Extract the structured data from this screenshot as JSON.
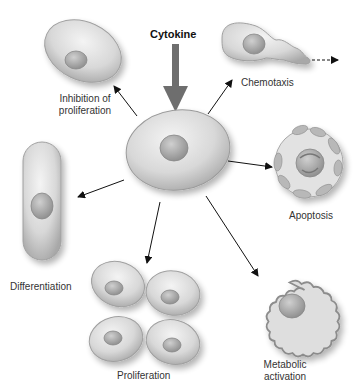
{
  "diagram": {
    "center_input": "Cytokine",
    "center_node": "Target cell",
    "effects": [
      {
        "id": "inhibition",
        "label_line1": "Inhibition of",
        "label_line2": "proliferation"
      },
      {
        "id": "chemotaxis",
        "label_line1": "Chemotaxis"
      },
      {
        "id": "apoptosis",
        "label_line1": "Apoptosis"
      },
      {
        "id": "metabolic",
        "label_line1": "Metabolic",
        "label_line2": "activation"
      },
      {
        "id": "proliferation",
        "label_line1": "Proliferation"
      },
      {
        "id": "differentiation",
        "label_line1": "Differentiation"
      }
    ]
  }
}
